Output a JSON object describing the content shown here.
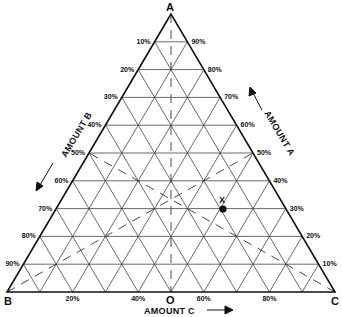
{
  "diagram": {
    "type": "ternary",
    "vertices": {
      "top": {
        "label": "A"
      },
      "left": {
        "label": "B"
      },
      "right": {
        "label": "C"
      }
    },
    "origin_label": "O",
    "axis_titles": {
      "a": "AMOUNT A",
      "b": "AMOUNT B",
      "c": "AMOUNT C"
    },
    "left_edge_ticks": [
      "10%",
      "20%",
      "30%",
      "40%",
      "50%",
      "60%",
      "70%",
      "80%",
      "90%"
    ],
    "right_edge_ticks": [
      "90%",
      "80%",
      "70%",
      "60%",
      "50%",
      "40%",
      "30%",
      "20%",
      "10%"
    ],
    "bottom_edge_ticks": [
      "20%",
      "40%",
      "60%",
      "80%"
    ],
    "point": {
      "label": "X",
      "a_pct": 30,
      "b_pct": 20,
      "c_pct": 50
    },
    "colors": {
      "line": "#222222",
      "grid": "#444444",
      "background": "#ffffff"
    }
  }
}
